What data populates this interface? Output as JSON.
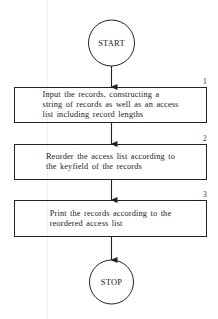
{
  "flowchart": {
    "start": {
      "label": "START"
    },
    "steps": [
      {
        "number": "1",
        "lines": [
          "Input the records, constructing a",
          "string of records as well as an access",
          "list including record lengths"
        ]
      },
      {
        "number": "2",
        "lines": [
          "Reorder the access list according to",
          "the keyfield of the records"
        ]
      },
      {
        "number": "3",
        "lines": [
          "Print the records according to the",
          "reordered access list"
        ]
      }
    ],
    "stop": {
      "label": "STOP"
    }
  },
  "colors": {
    "stroke": "#222222",
    "background": "#ffffff"
  }
}
